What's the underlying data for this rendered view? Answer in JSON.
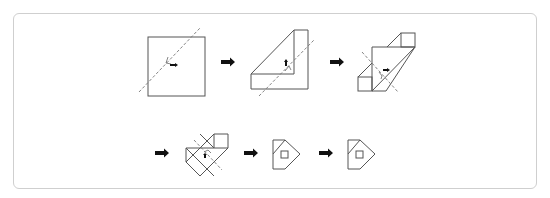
{
  "diagram": {
    "title": "",
    "type": "paper-folding-sequence",
    "rows": [
      {
        "steps": [
          {
            "id": "step-1",
            "shape": "square",
            "fold_line": "diagonal-dashed",
            "fold_direction": "left"
          },
          {
            "id": "step-2",
            "shape": "folded-L",
            "fold_line": "diagonal-dashed",
            "fold_direction": "up"
          },
          {
            "id": "step-3",
            "shape": "parallelogram-with-flaps",
            "fold_line": "diagonal-dashed",
            "fold_direction": "right"
          }
        ]
      },
      {
        "steps": [
          {
            "id": "step-4",
            "shape": "overlapping-diamond",
            "fold_line": "diagonal-dashed",
            "fold_direction": "down"
          },
          {
            "id": "step-5",
            "shape": "pentagon-with-square-hole"
          },
          {
            "id": "step-6",
            "shape": "pentagon-with-square-hole"
          }
        ]
      }
    ],
    "arrow_count": 5,
    "colors": {
      "line": "#555555",
      "arrow": "#111111",
      "frame": "#cfcfcf",
      "background": "#ffffff"
    }
  }
}
